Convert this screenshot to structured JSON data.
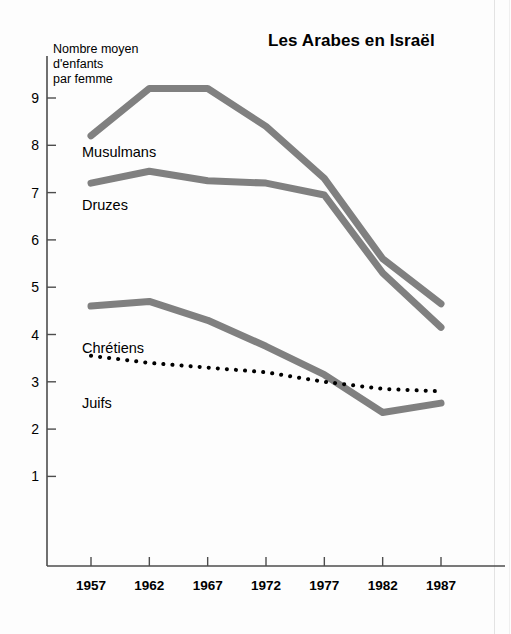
{
  "page": {
    "cut_off_headline": "Fécondité et confessions"
  },
  "chart_data": {
    "type": "line",
    "title": "Les Arabes en Israël",
    "ylabel": "Nombre moyen\nd'enfants\npar femme",
    "ylabel_lines": [
      "Nombre moyen",
      "d'enfants",
      "par femme"
    ],
    "xlabel": "",
    "x": [
      1957,
      1962,
      1967,
      1972,
      1977,
      1982,
      1987
    ],
    "categories": [
      "1957",
      "1962",
      "1967",
      "1972",
      "1977",
      "1982",
      "1987"
    ],
    "ylim": [
      0,
      9.8
    ],
    "yticks": [
      1,
      2,
      3,
      4,
      5,
      6,
      7,
      8,
      9
    ],
    "ytick_labels": [
      "1",
      "2",
      "3",
      "4",
      "5",
      "6",
      "7",
      "8",
      "9"
    ],
    "grid": false,
    "legend": "inline-labels",
    "series": [
      {
        "name": "Musulmans",
        "style": "solid",
        "color": "#808080",
        "width": 7,
        "values": [
          8.2,
          9.2,
          9.2,
          8.4,
          7.3,
          5.6,
          4.65
        ]
      },
      {
        "name": "Druzes",
        "style": "solid",
        "color": "#808080",
        "width": 7,
        "values": [
          7.2,
          7.45,
          7.25,
          7.2,
          6.95,
          5.3,
          4.15
        ]
      },
      {
        "name": "Chrétiens",
        "style": "solid",
        "color": "#808080",
        "width": 7,
        "values": [
          4.6,
          4.7,
          4.3,
          3.75,
          3.15,
          2.35,
          2.55
        ]
      },
      {
        "name": "Juifs",
        "style": "dotted",
        "color": "#000000",
        "width": 4,
        "values": [
          3.55,
          3.4,
          3.3,
          3.2,
          3.0,
          2.85,
          2.8
        ]
      }
    ],
    "axis_color": "#4d4d4d"
  }
}
